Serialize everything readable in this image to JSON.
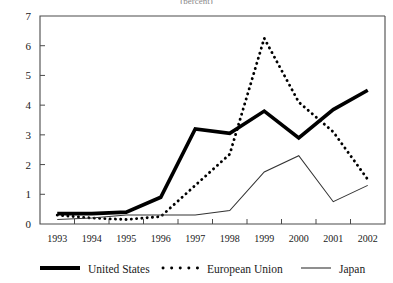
{
  "chart_data": {
    "type": "line",
    "title": "(percent)",
    "xlabel": "",
    "ylabel": "",
    "x": [
      1993,
      1994,
      1995,
      1996,
      1997,
      1998,
      1999,
      2000,
      2001,
      2002
    ],
    "categories": [
      "1993",
      "1994",
      "1995",
      "1996",
      "1997",
      "1998",
      "1999",
      "2000",
      "2001",
      "2002"
    ],
    "ylim": [
      0,
      7
    ],
    "yticks": [
      0,
      1,
      2,
      3,
      4,
      5,
      6,
      7
    ],
    "ytick_labels": [
      "0",
      "1",
      "2",
      "3",
      "4",
      "5",
      "6",
      "7"
    ],
    "grid": false,
    "legend_position": "bottom",
    "series": [
      {
        "name": "United States",
        "style": "solid-thick",
        "color": "#000000",
        "values": [
          0.35,
          0.35,
          0.4,
          0.9,
          3.2,
          3.05,
          3.8,
          2.9,
          3.85,
          4.5
        ]
      },
      {
        "name": "European Union",
        "style": "dotted",
        "color": "#000000",
        "values": [
          0.3,
          0.2,
          0.15,
          0.25,
          1.3,
          2.35,
          6.25,
          4.1,
          3.1,
          1.5
        ]
      },
      {
        "name": "Japan",
        "style": "solid-thin",
        "color": "#333333",
        "values": [
          0.15,
          0.2,
          0.3,
          0.3,
          0.3,
          0.45,
          1.75,
          2.3,
          0.75,
          1.3
        ]
      }
    ]
  },
  "legend": {
    "items": [
      {
        "label": "United States",
        "swatch": "solid-thick"
      },
      {
        "label": "European Union",
        "swatch": "dotted"
      },
      {
        "label": "Japan",
        "swatch": "solid-thin"
      }
    ]
  }
}
